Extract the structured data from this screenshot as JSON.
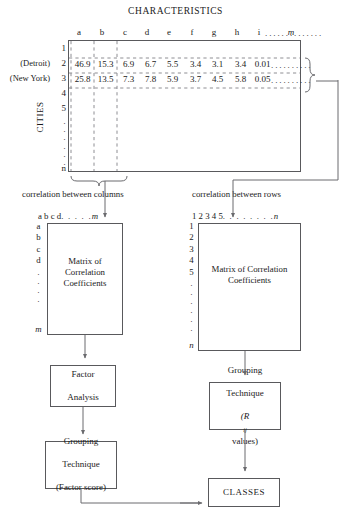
{
  "diagram": {
    "title": "CHARACTERISTICS",
    "axis_label_rows": "CITIES"
  },
  "top_table": {
    "column_headers": [
      "a",
      "b",
      "c",
      "d",
      "e",
      "f",
      "g",
      "h",
      "i"
    ],
    "column_tail_dots": "..............",
    "column_last": "m",
    "row_numbers": [
      "1",
      "2",
      "3",
      "4",
      "5"
    ],
    "row_tail_dots": [
      "·",
      "·",
      "·",
      "·",
      "·",
      "·"
    ],
    "row_last": "n",
    "named_rows": [
      {
        "number": "2",
        "name": "(Detroit)",
        "values": [
          "46.9",
          "15.3",
          "6.9",
          "6.7",
          "5.5",
          "3.4",
          "3.1",
          "3.4",
          "0.01"
        ],
        "tail": ".........."
      },
      {
        "number": "3",
        "name": "(New York)",
        "values": [
          "25.8",
          "13.5",
          "7.3",
          "7.8",
          "5.9",
          "3.7",
          "4.5",
          "5.8",
          "0.05"
        ],
        "tail": ".........."
      }
    ]
  },
  "captions": {
    "left": "correlation between columns",
    "right": "correlation between rows"
  },
  "left_matrix": {
    "col_headers": "a b c d",
    "col_dots": ". . . . .",
    "col_last": "m",
    "row_headers": [
      "a",
      "b",
      "c",
      "d"
    ],
    "row_dots": [
      "·",
      "·",
      "·",
      "·"
    ],
    "row_last": "m",
    "label_line1": "Matrix of",
    "label_line2": "Correlation",
    "label_line3": "Coefficients"
  },
  "right_matrix": {
    "col_headers": "1 2 3 4 5",
    "col_dots": ". . . . . . . .",
    "col_last": "n",
    "row_headers": [
      "1",
      "2",
      "3",
      "4",
      "5"
    ],
    "row_dots": [
      "·",
      "·",
      "·",
      "·",
      "·",
      "·"
    ],
    "row_last": "n",
    "label_line1": "Matrix of",
    "label_line2": "Correlation",
    "label_line3": "Coefficients"
  },
  "boxes": {
    "factor_analysis": {
      "line1": "Factor",
      "line2": "Analysis"
    },
    "grouping_rij": {
      "line1": "Grouping",
      "line2": "Technique",
      "line3_pre": "(R",
      "line3_sub": "ij",
      "line3_post": " values)"
    },
    "grouping_factor": {
      "line1": "Grouping",
      "line2": "Technique",
      "line3": "(Factor score)"
    },
    "classes": {
      "label": "CLASSES"
    }
  },
  "colors": {
    "stroke": "#59595c",
    "dashed": "#9a9a9e",
    "text": "#1a1a1a"
  }
}
